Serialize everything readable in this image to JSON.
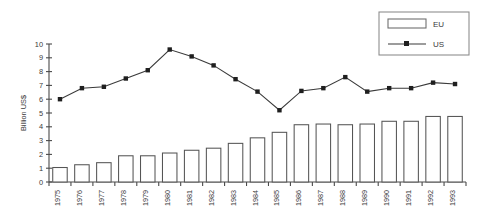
{
  "chart_data": {
    "type": "bar",
    "title": "",
    "xlabel": "",
    "ylabel": "Billion US$",
    "ylim": [
      0,
      10
    ],
    "yticks": [
      0,
      1,
      2,
      3,
      4,
      5,
      6,
      7,
      8,
      9,
      10
    ],
    "grid": false,
    "legend_position": "top-right",
    "categories": [
      "1975",
      "1976",
      "1977",
      "1978",
      "1979",
      "1980",
      "1981",
      "1982",
      "1983",
      "1984",
      "1985",
      "1986",
      "1987",
      "1988",
      "1989",
      "1990",
      "1991",
      "1992",
      "1993"
    ],
    "series": [
      {
        "name": "EU",
        "type": "bar",
        "values": [
          1.05,
          1.25,
          1.4,
          1.9,
          1.9,
          2.1,
          2.3,
          2.45,
          2.8,
          3.2,
          3.6,
          4.15,
          4.2,
          4.15,
          4.2,
          4.4,
          4.4,
          4.75,
          4.75
        ]
      },
      {
        "name": "US",
        "type": "line",
        "values": [
          6.0,
          6.8,
          6.9,
          7.5,
          8.1,
          9.6,
          9.1,
          8.45,
          7.45,
          6.55,
          5.2,
          6.6,
          6.8,
          7.6,
          6.55,
          6.8,
          6.8,
          7.2,
          7.1
        ]
      }
    ]
  },
  "legend": {
    "items": [
      {
        "label": "EU",
        "marker": "bar-swatch"
      },
      {
        "label": "US",
        "marker": "line-square-marker"
      }
    ]
  }
}
